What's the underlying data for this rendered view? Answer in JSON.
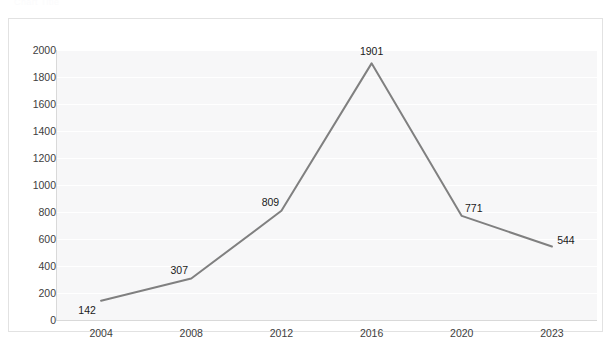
{
  "header": {
    "ghost_text": "Chart Title"
  },
  "chart_data": {
    "type": "line",
    "title": "",
    "xlabel": "",
    "ylabel": "",
    "categories": [
      "2004",
      "2008",
      "2012",
      "2016",
      "2020",
      "2023"
    ],
    "values": [
      142,
      307,
      809,
      1901,
      771,
      544
    ],
    "data_labels": [
      "142",
      "307",
      "809",
      "1901",
      "771",
      "544"
    ],
    "ylim": [
      0,
      2000
    ],
    "y_ticks": [
      "0",
      "200",
      "400",
      "600",
      "800",
      "1000",
      "1200",
      "1400",
      "1600",
      "1800",
      "2000"
    ],
    "y_tick_values": [
      0,
      200,
      400,
      600,
      800,
      1000,
      1200,
      1400,
      1600,
      1800,
      2000
    ],
    "grid": true,
    "legend": false,
    "legend_position": "none",
    "series": [
      {
        "name": "Series 1",
        "values": [
          142,
          307,
          809,
          1901,
          771,
          544
        ]
      }
    ],
    "colors": {
      "line": "#808080",
      "plot_background": "#f7f7f8",
      "gridline": "#ffffff",
      "axis": "#d9d9d9",
      "label_text": "#1a1a1a",
      "tick_text": "#404040",
      "frame_border": "#e2e2e2"
    }
  }
}
